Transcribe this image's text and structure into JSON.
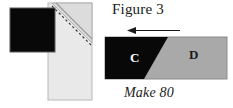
{
  "figure": {
    "title": "Figure 3",
    "caption": "Make 80",
    "domain": "quilting-instruction-diagram"
  },
  "left_diagram": {
    "name": "sewing-step-diagram",
    "description": "Black square overlapping a light gray rectangle with a folded triangular flap and a dashed diagonal stitching line",
    "shapes": [
      {
        "name": "background-strip",
        "fill": "#e9e9e9",
        "stroke": "#b8b8b8",
        "x": 48,
        "y": 3,
        "width": 44,
        "height": 97
      },
      {
        "name": "folded-triangle-flap",
        "fill": "#dcdcdc",
        "stroke": "#b0b0b0",
        "points": "92,3 92,43 52,3"
      },
      {
        "name": "black-square",
        "fill": "#080808",
        "stroke": "#555555",
        "x": 10,
        "y": 8,
        "width": 45,
        "height": 44
      },
      {
        "name": "dashed-stitch-line",
        "stroke": "#444444",
        "dash": "2.5,2.5",
        "x1": 52,
        "y1": 6,
        "x2": 91,
        "y2": 45
      },
      {
        "name": "fold-edge-line",
        "stroke": "#9a9a9a",
        "x1": 56,
        "y1": 3,
        "x2": 92,
        "y2": 39
      }
    ]
  },
  "right_diagram": {
    "name": "finished-unit-diagram",
    "arrow": {
      "name": "direction-arrow",
      "direction": "left",
      "color": "#1a1a1a",
      "x1": 180,
      "x2": 128,
      "y": 31
    },
    "shapes": [
      {
        "name": "unit-rectangle",
        "fill": "#a9a9a9",
        "stroke": "#8c8c8c",
        "x": 105,
        "y": 37,
        "width": 122,
        "height": 42
      },
      {
        "name": "black-diagonal-piece",
        "fill": "#080808",
        "points": "105,37 168,37 144,79 105,79"
      }
    ],
    "labels": {
      "piece_c": "C",
      "piece_d": "D"
    }
  },
  "colors": {
    "background": "#ffffff",
    "dark_fabric": "#080808",
    "medium_gray_fabric": "#a9a9a9",
    "light_gray_fabric": "#e9e9e9",
    "fold_gray": "#dcdcdc",
    "text": "#1a1a1a",
    "white_text": "#ffffff"
  }
}
